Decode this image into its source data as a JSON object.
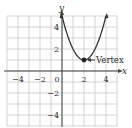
{
  "chart_data": {
    "type": "line",
    "title": "",
    "xlabel": "x",
    "ylabel": "y",
    "xlim": [
      -5,
      5
    ],
    "ylim": [
      -5,
      5
    ],
    "grid": true,
    "x_ticks": [
      -4,
      -2,
      0,
      2,
      4
    ],
    "x_tick_labels": [
      "−4",
      "−2",
      "0",
      "2",
      "4"
    ],
    "y_ticks": [
      4,
      2,
      -2,
      -4
    ],
    "y_tick_labels": [
      "4",
      "2",
      "−2",
      "−4"
    ],
    "series": [
      {
        "name": "parabola",
        "equation": "y = (x - 2)^2 + 1",
        "x": [
          0,
          0.5,
          1,
          1.5,
          2,
          2.5,
          3,
          3.5,
          4
        ],
        "y": [
          5,
          3.25,
          2,
          1.25,
          1,
          1.25,
          2,
          3.25,
          5
        ],
        "arrows_at_ends": true,
        "color": "#333333"
      }
    ],
    "annotations": [
      {
        "text": "Vertex",
        "point": [
          2,
          1
        ],
        "marker": "filled-dot",
        "pointer": "arrow"
      }
    ],
    "colors": {
      "grid": "#c8c8c8",
      "axis": "#444444",
      "curve": "#333333"
    }
  }
}
